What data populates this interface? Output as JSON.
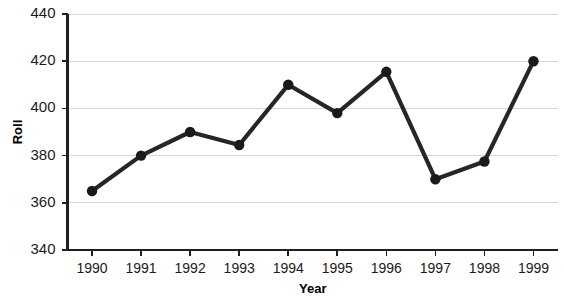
{
  "chart_data": {
    "type": "line",
    "title": "",
    "xlabel": "Year",
    "ylabel": "Roll",
    "categories": [
      "1990",
      "1991",
      "1992",
      "1993",
      "1994",
      "1995",
      "1996",
      "1997",
      "1998",
      "1999"
    ],
    "values": [
      365,
      380,
      390,
      384.5,
      410,
      398,
      415.5,
      370,
      377.5,
      420
    ],
    "series": [
      {
        "name": "Roll",
        "values": [
          365,
          380,
          390,
          384.5,
          410,
          398,
          415.5,
          370,
          377.5,
          420
        ]
      }
    ],
    "ylim": [
      340,
      440
    ],
    "yticks": [
      340,
      360,
      380,
      400,
      420,
      440
    ],
    "ytick_labels": [
      "340",
      "360",
      "380",
      "400",
      "420",
      "440"
    ],
    "xtick_labels": [
      "1990",
      "1991",
      "1992",
      "1993",
      "1994",
      "1995",
      "1996",
      "1997",
      "1998",
      "1999"
    ],
    "grid": "horizontal",
    "legend": "none",
    "marker": "circle",
    "line_color": "#262626",
    "marker_color": "#1a1a1a",
    "grid_color": "#d7d7d7",
    "axis_color": "#1f1f1f",
    "background_color": "#ffffff"
  }
}
